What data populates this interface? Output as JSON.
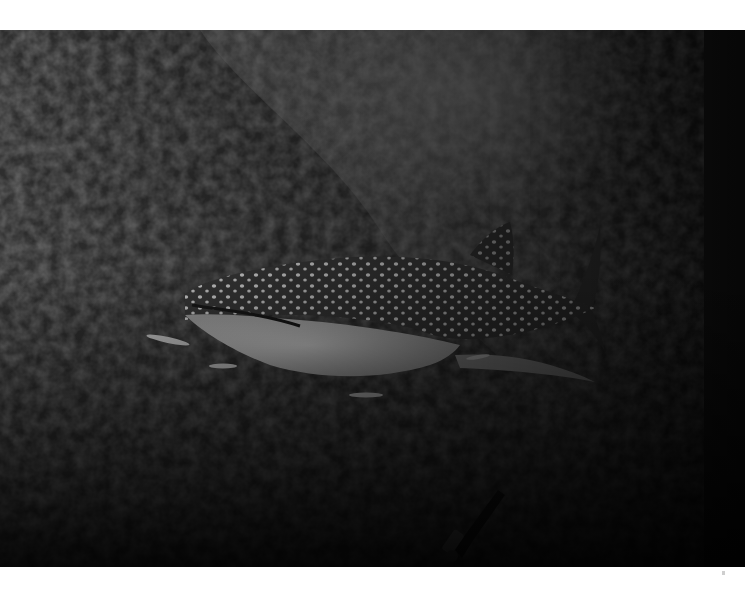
{
  "image": {
    "subject": "whale shark swimming over a reef wall",
    "tone": "black-and-white",
    "elements": [
      "whale-shark",
      "remora-fish",
      "reef-wall",
      "scuba-diver",
      "light-rays"
    ]
  },
  "colors": {
    "background": "#ffffff",
    "water_light": "#8a8a8a",
    "water_dark": "#141414",
    "shark_belly": "#d8d8d8",
    "shark_back": "#3a3a3a",
    "spots": "#e6e6e6"
  }
}
